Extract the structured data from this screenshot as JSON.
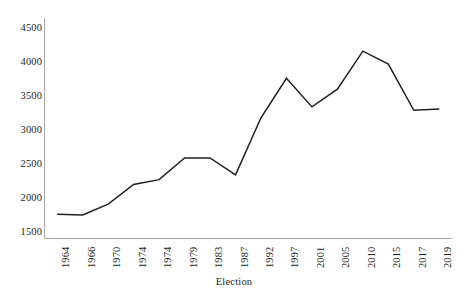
{
  "chart_data": {
    "type": "line",
    "title": "",
    "subtitle": "",
    "xlabel": "Election",
    "ylabel": "",
    "categories": [
      "1964",
      "1966",
      "1970",
      "1974",
      "1974",
      "1979",
      "1983",
      "1987",
      "1992",
      "1997",
      "2001",
      "2005",
      "2010",
      "2015",
      "2017",
      "2019"
    ],
    "values": [
      1760,
      1750,
      1910,
      2200,
      2270,
      2590,
      2590,
      2340,
      3180,
      3760,
      3340,
      3600,
      4160,
      3970,
      3290,
      3310
    ],
    "series": [
      {
        "name": "Election",
        "values": [
          1760,
          1750,
          1910,
          2200,
          2270,
          2590,
          2590,
          2340,
          3180,
          3760,
          3340,
          3600,
          4160,
          3970,
          3290,
          3310
        ]
      }
    ],
    "ylim": [
      1500,
      4500
    ],
    "yticks": [
      1500,
      2000,
      2500,
      3000,
      3500,
      4000,
      4500
    ],
    "ytick_labels": [
      "1500",
      "2000",
      "2500",
      "3000",
      "3500",
      "4000",
      "4500"
    ],
    "grid": false,
    "legend": false,
    "legend_position": "none",
    "line_color": "#231f20",
    "axis_color": "#a6a6a6",
    "background": "#ffffff"
  },
  "axes": {
    "x_title": "Election"
  }
}
